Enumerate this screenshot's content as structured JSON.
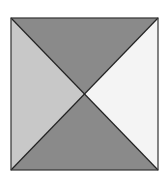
{
  "diagram": {
    "shape": "square divided by diagonals into four triangles",
    "colors": {
      "background": "#ffffff",
      "top": "#8a8a8a",
      "bottom": "#8a8a8a",
      "left": "#c8c8c8",
      "right": "#f4f4f4",
      "stroke": "#222222"
    },
    "square": {
      "x1": 11,
      "y1": 18,
      "x2": 158,
      "y2": 170
    }
  }
}
